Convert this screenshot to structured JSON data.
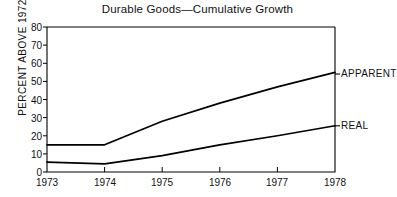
{
  "chart_data": {
    "type": "line",
    "title": "Durable Goods—Cumulative Growth",
    "xlabel": "",
    "ylabel": "PERCENT ABOVE 1972",
    "x": [
      1973,
      1974,
      1975,
      1976,
      1977,
      1978
    ],
    "xtick_labels": [
      "1973",
      "1974",
      "1975",
      "1976",
      "1977",
      "1978"
    ],
    "ytick_labels": [
      "0",
      "10",
      "20",
      "30",
      "40",
      "50",
      "60",
      "70",
      "80"
    ],
    "yticks": [
      0,
      10,
      20,
      30,
      40,
      50,
      60,
      70,
      80
    ],
    "xlim": [
      1973,
      1978
    ],
    "ylim": [
      0,
      80
    ],
    "grid": false,
    "legend_position": "right-inline",
    "series": [
      {
        "name": "APPARENT",
        "label": "APPARENT",
        "values": [
          15,
          15,
          28,
          38,
          47,
          55
        ],
        "color": "#000000"
      },
      {
        "name": "REAL",
        "label": "REAL",
        "values": [
          5.5,
          4.5,
          9,
          15,
          20,
          25.5
        ],
        "color": "#000000"
      }
    ]
  },
  "axes": {
    "frame_color": "#000000",
    "background": "#ffffff"
  }
}
